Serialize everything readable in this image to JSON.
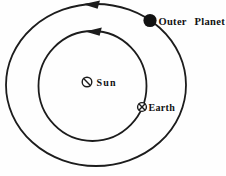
{
  "colors": {
    "line": "#1c1c1c",
    "text": "#111111",
    "planet_fill": "#111111",
    "background": "#fefefe"
  },
  "diagram": {
    "outer_orbit": {
      "cx": 96,
      "cy": 85,
      "rx": 90,
      "ry": 81
    },
    "inner_orbit": {
      "cx": 92.5,
      "cy": 86,
      "rx": 54,
      "ry": 55
    },
    "outer_arrow": {
      "points": "83,4.2 100,0.6 97.6,8.8"
    },
    "inner_arrow": {
      "points": "85.2,31.4 101.8,27.6 99.6,35.8"
    },
    "sun": {
      "symbol": {
        "cx": 87,
        "cy": 82,
        "r": 4.8,
        "slash": {
          "x1": 83.6,
          "y1": 78.6,
          "x2": 90.4,
          "y2": 85.4
        }
      },
      "label": {
        "text": "Sun",
        "x": 96.5,
        "y": 85.5
      }
    },
    "earth": {
      "symbol": {
        "cx": 142,
        "cy": 107,
        "r": 4.4,
        "cross": [
          {
            "x1": 139.1,
            "y1": 104.1,
            "x2": 144.9,
            "y2": 109.9
          },
          {
            "x1": 144.9,
            "y1": 104.1,
            "x2": 139.1,
            "y2": 109.9
          }
        ]
      },
      "label": {
        "text": "Earth",
        "x": 148.5,
        "y": 110.5
      }
    },
    "outer_planet": {
      "symbol": {
        "cx": 150,
        "cy": 20.5,
        "r": 6.6
      },
      "label": {
        "text": "Outer Planet",
        "x": 158.5,
        "y": 24.5
      }
    }
  }
}
